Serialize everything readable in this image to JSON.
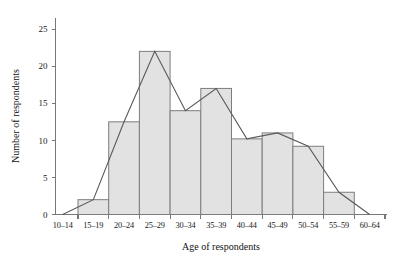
{
  "chart_data": {
    "type": "bar",
    "title": "",
    "subtitle": "",
    "xlabel": "Age of respondents",
    "ylabel": "Number of respondents",
    "categories": [
      "10–14",
      "15–19",
      "20–24",
      "25–29",
      "30–34",
      "35–39",
      "40–44",
      "45–49",
      "50–54",
      "55–59",
      "60–64"
    ],
    "values": [
      0,
      2,
      12.5,
      22,
      14,
      17,
      10.2,
      11,
      9.2,
      3,
      0
    ],
    "series": [
      {
        "name": "Histogram bars",
        "type": "bar",
        "values": [
          0,
          2,
          12.5,
          22,
          14,
          17,
          10.2,
          11,
          9.2,
          3,
          0
        ]
      },
      {
        "name": "Frequency polygon",
        "type": "line",
        "values": [
          0,
          2,
          12.5,
          22,
          14,
          17,
          10.2,
          11,
          9.2,
          3,
          0
        ]
      }
    ],
    "ylim": [
      0,
      26.5
    ],
    "yticks": [
      0,
      5,
      10,
      15,
      20,
      25
    ],
    "ytick_labels": [
      "0",
      "5",
      "10",
      "15",
      "20",
      "25"
    ],
    "grid": false,
    "legend": false,
    "legend_position": "none",
    "colors": {
      "bar_fill": "#e2e2e2",
      "bar_stroke": "#7d7d7d",
      "polygon_stroke": "#5a5a5a",
      "axis": "#777777",
      "text": "#1a1a1a",
      "background": "#ffffff"
    }
  }
}
